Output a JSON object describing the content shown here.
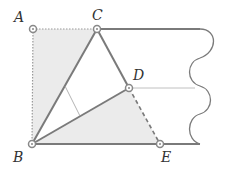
{
  "diagram": {
    "points": {
      "A": {
        "label": "A",
        "x": 33,
        "y": 29
      },
      "C": {
        "label": "C",
        "x": 97,
        "y": 29
      },
      "B": {
        "label": "B",
        "x": 32,
        "y": 144
      },
      "D": {
        "label": "D",
        "x": 129,
        "y": 88
      },
      "E": {
        "label": "E",
        "x": 160,
        "y": 144
      }
    },
    "colors": {
      "line": "#7a7a7a",
      "fill": "#e8e8e8",
      "thin": "#b0b0b0"
    }
  }
}
